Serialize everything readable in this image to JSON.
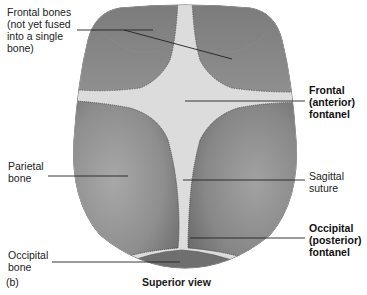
{
  "figure": {
    "panel_letter": "(b)",
    "caption": "Superior view",
    "colors": {
      "bone_dark": "#6e6e6e",
      "bone_mid": "#8c8c8c",
      "bone_light": "#a9a9a9",
      "fontanel": "#e6e6e6",
      "suture": "#d4d4d4",
      "leader_line": "#222222"
    }
  },
  "labels": {
    "frontal_bones": "Frontal bones\n(not yet fused\ninto a single\nbone)",
    "frontal_fontanel": "Frontal\n(anterior)\nfontanel",
    "parietal_bone": "Parietal\nbone",
    "sagittal_suture": "Sagittal\nsuture",
    "occipital_fontanel": "Occipital\n(posterior)\nfontanel",
    "occipital_bone": "Occipital\nbone"
  }
}
